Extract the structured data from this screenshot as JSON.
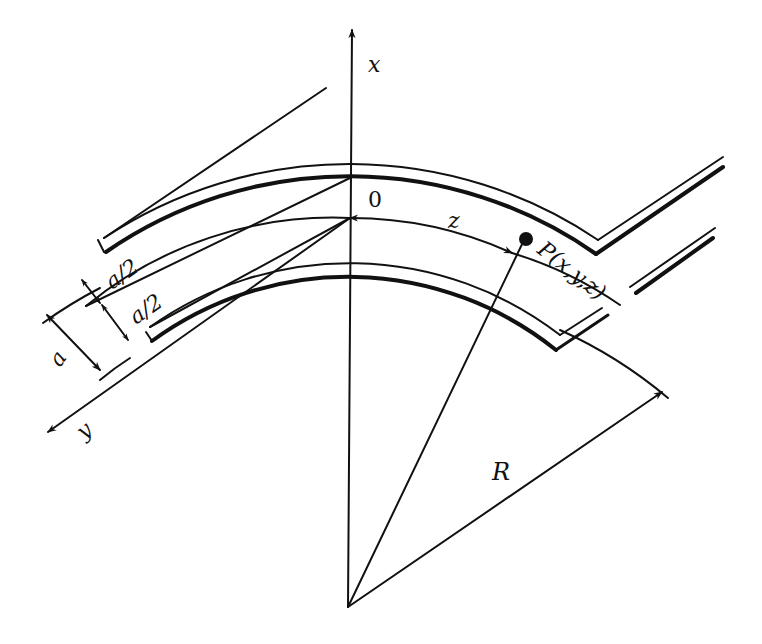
{
  "figure": {
    "type": "curved-waveguide-coordinate-diagram",
    "labels": {
      "x_axis": "x",
      "y_axis": "y",
      "z_axis": "z",
      "origin": "0",
      "point": "P(x,y,z)",
      "radius": "R",
      "width": "a",
      "half_width_top": "a/2",
      "half_width_bottom": "a/2"
    },
    "colors": {
      "ink": "#111111",
      "background": "#ffffff"
    }
  }
}
